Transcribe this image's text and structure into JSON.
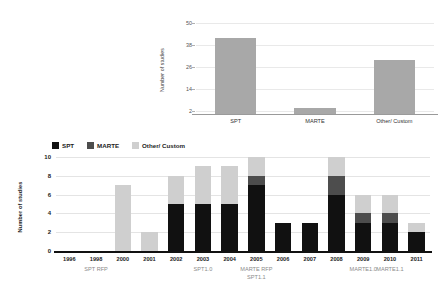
{
  "chart_data": [
    {
      "id": "top",
      "type": "bar",
      "title": "",
      "xlabel": "",
      "ylabel": "Number of studies",
      "categories": [
        "SPT",
        "MARTE",
        "Other/ Custom"
      ],
      "values": [
        42,
        4,
        30
      ],
      "ytick_labels": [
        "2",
        "14",
        "26",
        "38",
        "50"
      ],
      "ytick_values": [
        2,
        14,
        26,
        38,
        50
      ],
      "ylim": [
        0,
        54
      ],
      "grid": true,
      "legend": "none",
      "bar_color": "#a8a8a8"
    },
    {
      "id": "bottom",
      "type": "bar",
      "stacked": true,
      "title": "",
      "xlabel": "",
      "ylabel": "Number of studies",
      "categories": [
        "1996",
        "1998",
        "2000",
        "2001",
        "2002",
        "2003",
        "2004",
        "2005",
        "2006",
        "2007",
        "2008",
        "2009",
        "2010",
        "2011"
      ],
      "series": [
        {
          "name": "SPT",
          "color": "#111111",
          "values": [
            0,
            0,
            0,
            0,
            5,
            5,
            5,
            7,
            3,
            3,
            6,
            3,
            3,
            2
          ]
        },
        {
          "name": "MARTE",
          "color": "#4d4d4d",
          "values": [
            0,
            0,
            0,
            0,
            0,
            0,
            0,
            1,
            0,
            0,
            2,
            1,
            1,
            0
          ]
        },
        {
          "name": "Other/ Custom",
          "color": "#cfcfcf",
          "values": [
            0,
            0,
            7,
            2,
            3,
            4,
            4,
            2,
            0,
            0,
            2,
            2,
            2,
            1
          ]
        }
      ],
      "totals": [
        0,
        0,
        7,
        2,
        8,
        9,
        9,
        10,
        3,
        3,
        10,
        6,
        6,
        3
      ],
      "ytick_labels": [
        "0",
        "2",
        "4",
        "6",
        "8",
        "10"
      ],
      "ytick_values": [
        0,
        2,
        4,
        6,
        8,
        10
      ],
      "ylim": [
        0,
        10
      ],
      "grid": true,
      "legend_position": "top-left",
      "annotations": [
        {
          "text": "SPT RFP",
          "category": "1998"
        },
        {
          "text": "SPT1.0",
          "category": "2003"
        },
        {
          "text": "MARTE RFP",
          "category": "2005"
        },
        {
          "text": "SPT1.1",
          "category": "2005",
          "row": 2
        },
        {
          "text": "MARTE1.0",
          "category": "2009"
        },
        {
          "text": "MARTE1.1",
          "category": "2010"
        }
      ]
    }
  ],
  "top": {
    "ylabel": "Number of studies",
    "yticks": [
      "50",
      "38",
      "26",
      "14",
      "2"
    ],
    "xticks": [
      "SPT",
      "MARTE",
      "Other/ Custom"
    ]
  },
  "bottom": {
    "ylabel": "Number of studies",
    "yticks": [
      "10",
      "8",
      "6",
      "4",
      "2",
      "0"
    ],
    "years": [
      "1996",
      "1998",
      "2000",
      "2001",
      "2002",
      "2003",
      "2004",
      "2005",
      "2006",
      "2007",
      "2008",
      "2009",
      "2010",
      "2011"
    ],
    "legend": [
      {
        "label": "SPT",
        "color": "#111111"
      },
      {
        "label": "MARTE",
        "color": "#4d4d4d"
      },
      {
        "label": "Other/ Custom",
        "color": "#cfcfcf"
      }
    ],
    "annotations": [
      "SPT RFP",
      "SPT1.0",
      "MARTE RFP",
      "SPT1.1",
      "MARTE1.0",
      "MARTE1.1"
    ]
  }
}
